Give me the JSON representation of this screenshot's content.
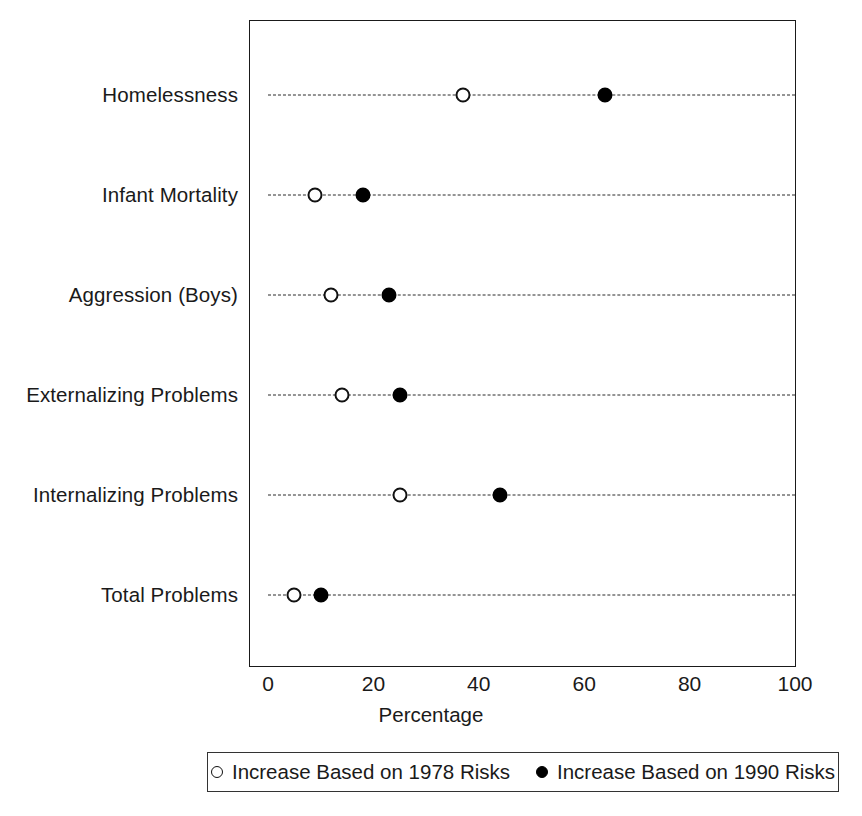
{
  "chart_data": {
    "type": "scatter",
    "title": "",
    "xlabel": "Percentage",
    "ylabel": "",
    "xlim": [
      0,
      100
    ],
    "xticks": [
      0,
      20,
      40,
      60,
      80,
      100
    ],
    "xtick_labels": [
      "0",
      "20",
      "40",
      "60",
      "80",
      "100"
    ],
    "grid": false,
    "legend_position": "bottom",
    "categories": [
      "Homelessness",
      "Infant Mortality",
      "Aggression (Boys)",
      "Externalizing Problems",
      "Internalizing Problems",
      "Total Problems"
    ],
    "series": [
      {
        "name": "Increase Based on 1978 Risks",
        "marker": "open-circle",
        "color": "#000000",
        "values": [
          37,
          9,
          12,
          14,
          25,
          5
        ]
      },
      {
        "name": "Increase Based on 1990 Risks",
        "marker": "filled-circle",
        "color": "#000000",
        "values": [
          64,
          18,
          23,
          25,
          44,
          10
        ]
      }
    ]
  },
  "legend": {
    "entries": [
      {
        "label": "Increase Based on 1978 Risks",
        "marker": "open-circle"
      },
      {
        "label": "Increase Based on 1990 Risks",
        "marker": "filled-circle"
      }
    ]
  },
  "axis": {
    "x_title": "Percentage"
  }
}
